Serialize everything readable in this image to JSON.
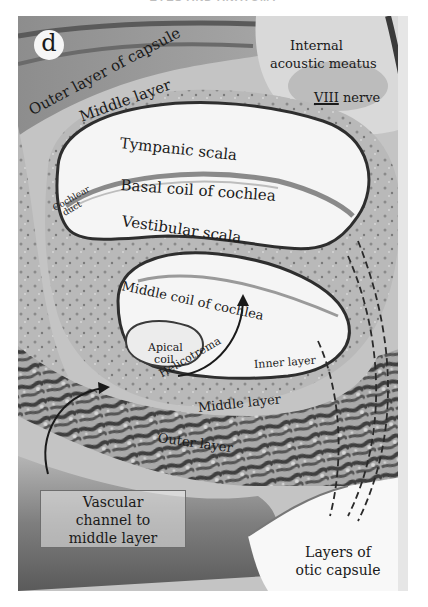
{
  "header": {
    "text": "EYES AND ANATOMY"
  },
  "figure": {
    "panel_letter": "d",
    "colors": {
      "background": "#ffffff",
      "tissue_light": "#cfcfcf",
      "tissue_mid": "#9a9a9a",
      "tissue_dark": "#4a4a4a",
      "lumen": "#f7f7f7",
      "label_text": "#1a1a1a"
    },
    "labels": {
      "outer_layer_capsule": "Outer layer of capsule",
      "middle_layer_top": "Middle layer",
      "internal": "Internal",
      "acoustic_meatus": "acoustic meatus",
      "viii": "VIII",
      "nerve": "nerve",
      "tympanic_scala": "Tympanic scala",
      "basal_coil": "Basal coil of cochlea",
      "cochlear": "Cochlear",
      "duct": "duct",
      "vestibular_scala": "Vestibular scala",
      "middle_coil": "Middle coil of cochlea",
      "apical": "Apical",
      "coil": "coil",
      "helicotrema": "Helicotrema",
      "inner_layer": "Inner layer",
      "middle_layer_bottom": "Middle layer",
      "outer_layer": "Outer layer",
      "vascular_box": [
        "Vascular",
        "channel to",
        "middle layer"
      ],
      "layers_otic": [
        "Layers of",
        "otic capsule"
      ]
    }
  }
}
